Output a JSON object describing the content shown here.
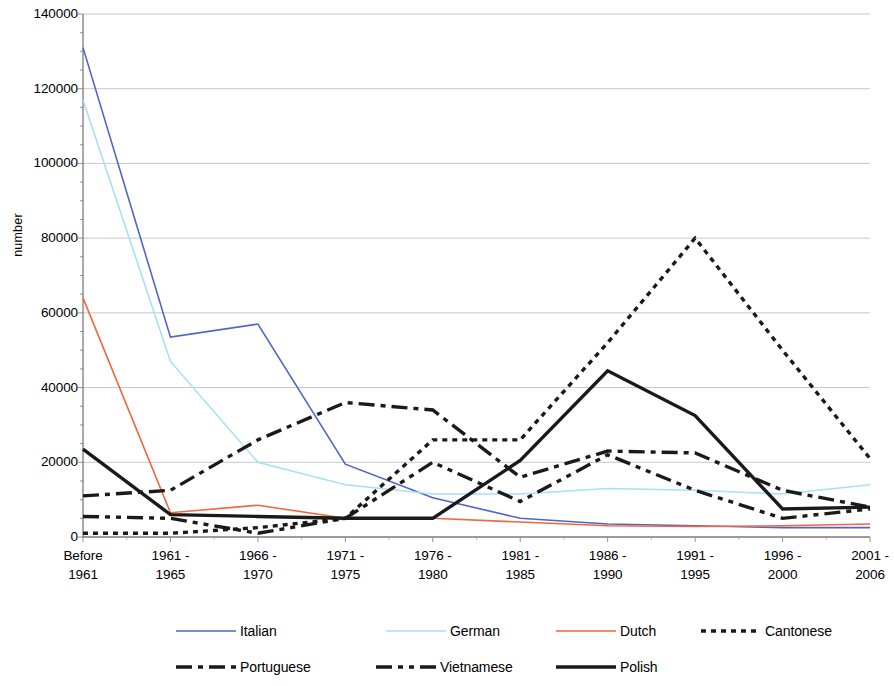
{
  "chart_data": {
    "type": "line",
    "title": "",
    "xlabel": "",
    "ylabel": "number",
    "ylim": [
      0,
      140000
    ],
    "yticks": [
      0,
      20000,
      40000,
      60000,
      80000,
      100000,
      120000,
      140000
    ],
    "ytick_labels": [
      "0",
      "20000",
      "40000",
      "60000",
      "80000",
      "100000",
      "120000",
      "140000"
    ],
    "grid": true,
    "legend_position": "bottom",
    "categories": [
      "Before 1961",
      "1961 - 1965",
      "1966 - 1970",
      "1971 - 1975",
      "1976 - 1980",
      "1981 - 1985",
      "1986 - 1990",
      "1991 - 1995",
      "1996 - 2000",
      "2001 - 2006"
    ],
    "category_lines": [
      [
        "Before",
        "1961"
      ],
      [
        "1961 -",
        "1965"
      ],
      [
        "1966 -",
        "1970"
      ],
      [
        "1971 -",
        "1975"
      ],
      [
        "1976 -",
        "1980"
      ],
      [
        "1981 -",
        "1985"
      ],
      [
        "1986 -",
        "1990"
      ],
      [
        "1991 -",
        "1995"
      ],
      [
        "1996 -",
        "2000"
      ],
      [
        "2001 -",
        "2006"
      ]
    ],
    "series": [
      {
        "name": "Italian",
        "color": "#5064c8",
        "style": "solid",
        "values": [
          131000,
          53500,
          57000,
          19500,
          10500,
          5000,
          3500,
          3000,
          2500,
          2500
        ]
      },
      {
        "name": "German",
        "color": "#a8e0f5",
        "style": "solid",
        "values": [
          117000,
          47000,
          20000,
          14000,
          11500,
          11500,
          13000,
          12500,
          11500,
          14000
        ]
      },
      {
        "name": "Dutch",
        "color": "#f4663c",
        "style": "solid",
        "values": [
          64000,
          6500,
          8500,
          5000,
          5000,
          4000,
          3000,
          2800,
          3000,
          3500
        ]
      },
      {
        "name": "Cantonese",
        "color": "#1a1a1a",
        "style": "dotted",
        "values": [
          1000,
          1000,
          2500,
          5000,
          26000,
          26000,
          52000,
          80000,
          50000,
          21000
        ]
      },
      {
        "name": "Portuguese",
        "color": "#1a1a1a",
        "style": "dashdot",
        "values": [
          11000,
          12500,
          26000,
          36000,
          34000,
          16000,
          23000,
          22500,
          12500,
          8000
        ]
      },
      {
        "name": "Vietnamese",
        "color": "#1a1a1a",
        "style": "dashdotdot",
        "values": [
          5500,
          5000,
          1000,
          5000,
          20000,
          9500,
          22000,
          12500,
          5000,
          7500
        ]
      },
      {
        "name": "Polish",
        "color": "#1a1a1a",
        "style": "solid-thick",
        "values": [
          23500,
          6000,
          5500,
          5000,
          5000,
          20500,
          44500,
          32500,
          7500,
          8000
        ]
      }
    ]
  },
  "legend": {
    "row1": [
      {
        "label": "Italian",
        "series": "Italian"
      },
      {
        "label": "German",
        "series": "German"
      },
      {
        "label": "Dutch",
        "series": "Dutch"
      },
      {
        "label": "Cantonese",
        "series": "Cantonese"
      }
    ],
    "row2": [
      {
        "label": "Portuguese",
        "series": "Portuguese"
      },
      {
        "label": "Vietnamese",
        "series": "Vietnamese"
      },
      {
        "label": "Polish",
        "series": "Polish"
      }
    ]
  }
}
